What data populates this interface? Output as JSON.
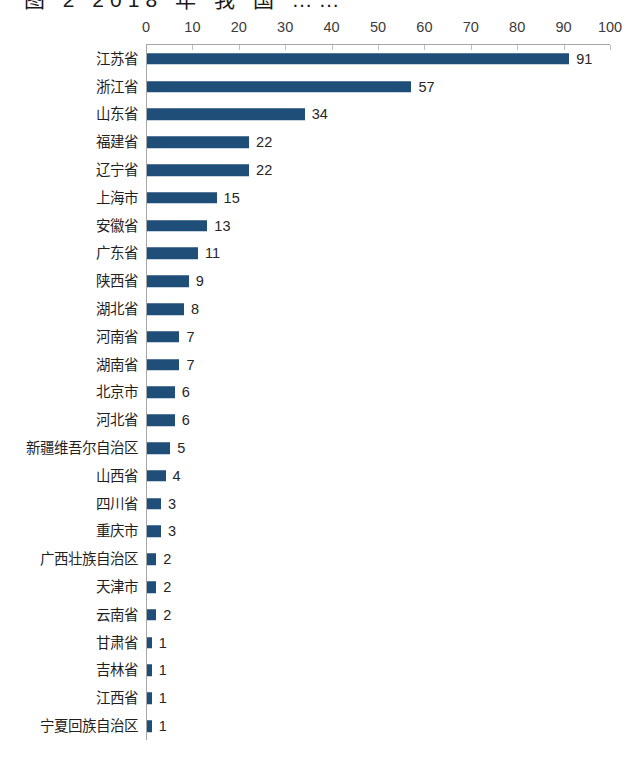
{
  "title_fragment": {
    "note": "cropped-illegible-title",
    "glyphs": "图 2  2018 年 我 国 ……"
  },
  "chart_data": {
    "type": "bar",
    "orientation": "horizontal",
    "title": "",
    "xlabel": "",
    "ylabel": "",
    "xlim": [
      0,
      100
    ],
    "xticks": [
      0,
      10,
      20,
      30,
      40,
      50,
      60,
      70,
      80,
      90,
      100
    ],
    "grid": false,
    "legend": false,
    "axis_position": "top",
    "bar_color": "#1F4E79",
    "categories": [
      "江苏省",
      "浙江省",
      "山东省",
      "福建省",
      "辽宁省",
      "上海市",
      "安徽省",
      "广东省",
      "陕西省",
      "湖北省",
      "河南省",
      "湖南省",
      "北京市",
      "河北省",
      "新疆维吾尔自治区",
      "山西省",
      "四川省",
      "重庆市",
      "广西壮族自治区",
      "天津市",
      "云南省",
      "甘肃省",
      "吉林省",
      "江西省",
      "宁夏回族自治区"
    ],
    "values": [
      91,
      57,
      34,
      22,
      22,
      15,
      13,
      11,
      9,
      8,
      7,
      7,
      6,
      6,
      5,
      4,
      3,
      3,
      2,
      2,
      2,
      1,
      1,
      1,
      1
    ],
    "data_labels": [
      "91",
      "57",
      "34",
      "22",
      "22",
      "15",
      "13",
      "11",
      "9",
      "8",
      "7",
      "7",
      "6",
      "6",
      "5",
      "4",
      "3",
      "3",
      "2",
      "2",
      "2",
      "1",
      "1",
      "1",
      "1"
    ]
  }
}
